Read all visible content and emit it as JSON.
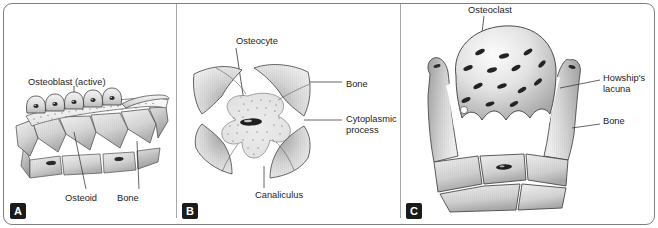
{
  "figure": {
    "border_color": "#7e7e82",
    "divider_color": "#a9a9ad",
    "background": "#ffffff",
    "panel_letter_bg": "#1b1b1b",
    "panel_letter_fg": "#ffffff"
  },
  "panels": [
    {
      "letter": "A",
      "subject": "osteoblast-active-on-osteoid-and-bone",
      "labels": [
        {
          "id": "osteoblast",
          "text": "Osteoblast (active)"
        },
        {
          "id": "osteoid",
          "text": "Osteoid"
        },
        {
          "id": "bone",
          "text": "Bone"
        }
      ],
      "counts": {
        "osteoblast_cells": 5,
        "bone_matrix_cells": 9
      }
    },
    {
      "letter": "B",
      "subject": "osteocyte-in-lacuna-with-canaliculi",
      "labels": [
        {
          "id": "osteocyte",
          "text": "Osteocyte"
        },
        {
          "id": "bone",
          "text": "Bone"
        },
        {
          "id": "cytoplasmic_process",
          "text": "Cytoplasmic process"
        },
        {
          "id": "canaliculus",
          "text": "Canaliculus"
        }
      ],
      "counts": {
        "bone_wedges": 4,
        "processes": 4
      }
    },
    {
      "letter": "C",
      "subject": "osteoclast-in-howships-lacuna",
      "labels": [
        {
          "id": "osteoclast",
          "text": "Osteoclast"
        },
        {
          "id": "howships_lacuna",
          "text": "Howship's lacuna"
        },
        {
          "id": "bone",
          "text": "Bone"
        }
      ],
      "counts": {
        "osteoclast_nuclei": 14,
        "ruffled_border_folds": 4,
        "bone_matrix_cells": 5
      }
    }
  ]
}
